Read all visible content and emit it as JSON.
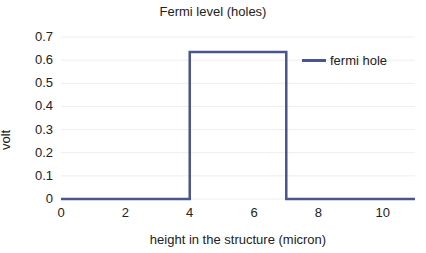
{
  "chart_data": {
    "type": "line",
    "title": "Fermi level (holes)",
    "xlabel": "height in the structure (micron)",
    "ylabel": "volt",
    "xlim": [
      0,
      11
    ],
    "ylim": [
      0,
      0.7
    ],
    "x_ticks": [
      "0",
      "2",
      "4",
      "6",
      "8",
      "10"
    ],
    "y_ticks": [
      "0",
      "0.1",
      "0.2",
      "0.3",
      "0.4",
      "0.5",
      "0.6",
      "0.7"
    ],
    "grid": true,
    "legend_position": "right",
    "series": [
      {
        "name": "fermi hole",
        "color": "#4a5590",
        "x": [
          0,
          4,
          4,
          7,
          7,
          11
        ],
        "y": [
          0,
          0,
          0.635,
          0.635,
          0,
          0
        ]
      }
    ]
  }
}
